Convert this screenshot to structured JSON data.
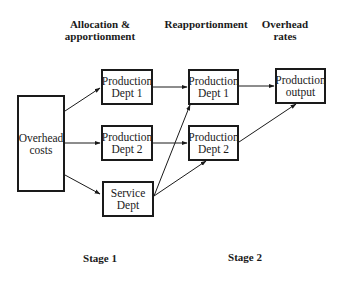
{
  "headers": {
    "allocation": "Allocation &\napportionment",
    "reapportionment": "Reapportionment",
    "overhead_rates": "Overhead\nrates"
  },
  "boxes": {
    "overhead_costs": "Overhead\ncosts",
    "prod_dept_1_stage1": "Production\nDept 1",
    "prod_dept_2_stage1": "Production\nDept 2",
    "service_dept": "Service\nDept",
    "prod_dept_1_stage2": "Production\nDept 1",
    "prod_dept_2_stage2": "Production\nDept 2",
    "production_output": "Production\noutput"
  },
  "stages": {
    "stage1": "Stage 1",
    "stage2": "Stage 2"
  },
  "colors": {
    "line": "#1a1a1a",
    "background": "#ffffff"
  }
}
